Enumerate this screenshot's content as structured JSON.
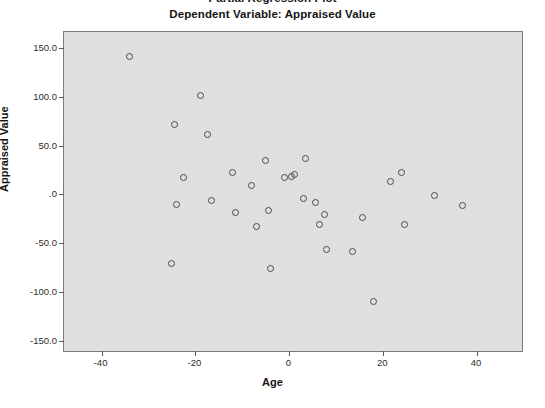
{
  "chart_data": {
    "type": "scatter",
    "title": "Partial Regression Plot",
    "subtitle": "Dependent Variable: Appraised Value",
    "xlabel": "Age",
    "ylabel": "Appraised Value",
    "xlim": [
      -48,
      50
    ],
    "ylim": [
      -162,
      166
    ],
    "xticks": [
      -40,
      -20,
      0,
      20,
      40
    ],
    "xticklabels": [
      "-40",
      "-20",
      "0",
      "20",
      "40"
    ],
    "yticks": [
      150,
      100,
      50,
      0,
      -50,
      -100,
      -150
    ],
    "yticklabels": [
      "150.0",
      "100.0",
      "50.0",
      ".0",
      "-50.0",
      "-100.0",
      "-150.0"
    ],
    "grid": false,
    "legend": false,
    "marker": "open-circle",
    "marker_color": "#4a4a4a",
    "plot_background": "#e2e2e2",
    "frame_color": "#7b7b7b",
    "points": [
      {
        "x": -34.0,
        "y": 141.0
      },
      {
        "x": -24.5,
        "y": 71.0
      },
      {
        "x": -19.0,
        "y": 101.0
      },
      {
        "x": -17.5,
        "y": 61.0
      },
      {
        "x": -22.5,
        "y": 17.0
      },
      {
        "x": -24.0,
        "y": -10.0
      },
      {
        "x": -16.5,
        "y": -6.0
      },
      {
        "x": -25.0,
        "y": -71.0
      },
      {
        "x": -12.0,
        "y": 22.0
      },
      {
        "x": -11.5,
        "y": -18.0
      },
      {
        "x": -8.0,
        "y": 9.0
      },
      {
        "x": -7.0,
        "y": -33.0
      },
      {
        "x": -5.0,
        "y": 35.0
      },
      {
        "x": -4.5,
        "y": -16.0
      },
      {
        "x": -4.0,
        "y": -76.0
      },
      {
        "x": -1.0,
        "y": 17.0
      },
      {
        "x": 0.5,
        "y": 18.0
      },
      {
        "x": 1.0,
        "y": 20.0
      },
      {
        "x": 3.5,
        "y": 37.0
      },
      {
        "x": 3.0,
        "y": -4.0
      },
      {
        "x": 5.5,
        "y": -8.0
      },
      {
        "x": 6.5,
        "y": -31.0
      },
      {
        "x": 8.0,
        "y": -56.0
      },
      {
        "x": 7.5,
        "y": -20.0
      },
      {
        "x": 13.5,
        "y": -58.0
      },
      {
        "x": 15.5,
        "y": -24.0
      },
      {
        "x": 18.0,
        "y": -109.0
      },
      {
        "x": 21.5,
        "y": 13.0
      },
      {
        "x": 24.0,
        "y": 22.0
      },
      {
        "x": 24.5,
        "y": -31.0
      },
      {
        "x": 31.0,
        "y": -1.0
      },
      {
        "x": 37.0,
        "y": -11.0
      }
    ]
  }
}
